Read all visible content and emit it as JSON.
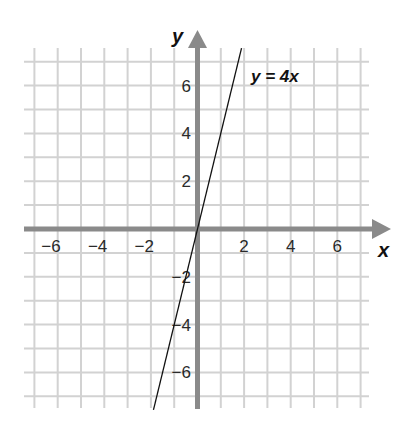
{
  "chart_data": {
    "type": "line",
    "title": "",
    "xlabel": "x",
    "ylabel": "y",
    "xlim": [
      -7.5,
      8
    ],
    "ylim": [
      -7.5,
      8
    ],
    "grid": true,
    "x_ticks": [
      -6,
      -4,
      -2,
      2,
      4,
      6
    ],
    "y_ticks": [
      6,
      4,
      2,
      -2,
      -4,
      -6
    ],
    "x_tick_labels": [
      "−6",
      "−4",
      "−2",
      "2",
      "4",
      "6"
    ],
    "y_tick_labels": [
      "6",
      "4",
      "2",
      "−2",
      "−4",
      "−6"
    ],
    "series": [
      {
        "name": "y = 4x",
        "equation": "y = 4x",
        "slope": 4,
        "intercept": 0,
        "x": [
          -1.89,
          0,
          1.89
        ],
        "y": [
          -7.57,
          0,
          7.57
        ]
      }
    ],
    "annotations": [
      {
        "text": "y = 4x",
        "x": 2.3,
        "y": 6.5
      }
    ],
    "colors": {
      "grid": "#d2d2d2",
      "axis": "#8a8a8a",
      "line": "#111111"
    }
  },
  "labels": {
    "x_axis": "x",
    "y_axis": "y",
    "equation": "y = 4x"
  }
}
